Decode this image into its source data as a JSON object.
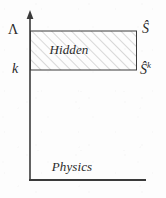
{
  "figure": {
    "background_color": "#fdfdfd",
    "ink_color": "#2a2a2a",
    "axis": {
      "vertical_name": "scale-axis",
      "horizontal_name": "baseline-axis",
      "has_arrowhead": true
    },
    "levels": [
      {
        "id": "cutoff",
        "left_label": "Λ",
        "right_label": "Ŝ",
        "y": 31
      },
      {
        "id": "running-scale",
        "left_label": "k",
        "right_label_base": "Ŝ",
        "right_label_sup": "k",
        "y": 70
      }
    ],
    "regions": [
      {
        "id": "hidden-region",
        "label": "Hidden",
        "fill": "hatched",
        "hatch_color": "#b8b8b8"
      },
      {
        "id": "physics-region",
        "label": "Physics",
        "fill": "none"
      }
    ]
  }
}
